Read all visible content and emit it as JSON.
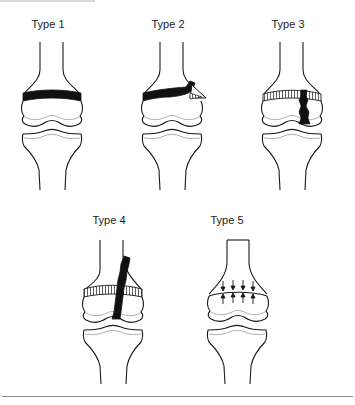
{
  "figure": {
    "panels": [
      {
        "id": "type1",
        "label": "Type 1",
        "description": "Fracture through the physis (growth plate)"
      },
      {
        "id": "type2",
        "label": "Type 2",
        "description": "Fracture through physis and metaphysis"
      },
      {
        "id": "type3",
        "label": "Type 3",
        "description": "Fracture through physis and epiphysis"
      },
      {
        "id": "type4",
        "label": "Type 4",
        "description": "Fracture through metaphysis, physis and epiphysis"
      },
      {
        "id": "type5",
        "label": "Type 5",
        "description": "Compression (crush) injury of the physis"
      }
    ]
  },
  "colors": {
    "line": "#1a1a1a",
    "fracture_fill": "#111111",
    "cartilage_line": "#9a9a9a",
    "background": "#ffffff",
    "rule": "#8a8a8a"
  }
}
